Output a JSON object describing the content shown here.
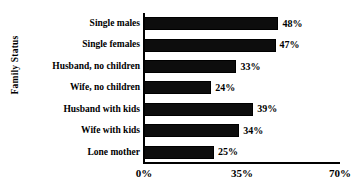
{
  "figure": {
    "top_clipped_text": "",
    "background_color": "#ffffff",
    "bar_color": "#0d0d0d",
    "axis_color": "#000000"
  },
  "axes": {
    "y_title": "Family Status",
    "x_ticks": [
      "0%",
      "35%",
      "70%"
    ]
  },
  "chart_data": {
    "type": "bar",
    "orientation": "horizontal",
    "title": "",
    "xlabel": "",
    "ylabel": "Family Status",
    "categories": [
      "Single males",
      "Single females",
      "Husband, no children",
      "Wife, no children",
      "Husband with kids",
      "Wife with kids",
      "Lone mother"
    ],
    "values": [
      48,
      47,
      33,
      24,
      39,
      34,
      25
    ],
    "value_labels": [
      "48%",
      "47%",
      "33%",
      "24%",
      "39%",
      "34%",
      "25%"
    ],
    "xlim": [
      0,
      70
    ],
    "xticks": [
      0,
      35,
      70
    ],
    "xtick_labels": [
      "0%",
      "35%",
      "70%"
    ],
    "grid": false,
    "legend": null,
    "units": "percent"
  }
}
